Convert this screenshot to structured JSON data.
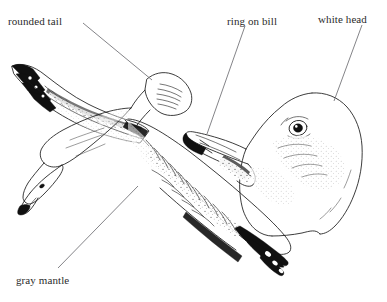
{
  "plate": {
    "title": "Ring-billed Gull field guide plate",
    "background_color": "#ffffff",
    "ink_color": "#1a1a1a",
    "label_color": "#2b2b2b",
    "leader_color": "#6e6e73",
    "width": 387,
    "height": 302
  },
  "labels": [
    {
      "id": "rounded-tail",
      "text": "rounded tail",
      "x": 8,
      "y": 15,
      "leader": {
        "x1": 83,
        "y1": 23,
        "x2": 152,
        "y2": 80
      }
    },
    {
      "id": "ring-on-bill",
      "text": "ring on bill",
      "x": 227,
      "y": 15,
      "leader": {
        "x1": 245,
        "y1": 26,
        "x2": 207,
        "y2": 134
      }
    },
    {
      "id": "white-head",
      "text": "white head",
      "x": 318,
      "y": 13,
      "leader": {
        "x1": 362,
        "y1": 25,
        "x2": 334,
        "y2": 101
      }
    },
    {
      "id": "gray-mantle",
      "text": "gray mantle",
      "x": 16,
      "y": 274,
      "leader": {
        "x1": 58,
        "y1": 268,
        "x2": 138,
        "y2": 186
      }
    }
  ],
  "figures": [
    {
      "id": "gull-in-flight",
      "name": "Gull seen from below in flight",
      "features": [
        "rounded tail",
        "gray mantle",
        "black wingtips with white mirrors",
        "white underparts",
        "pale head with dark-tipped bill"
      ]
    },
    {
      "id": "gull-head-portrait",
      "name": "Gull head profile facing left",
      "features": [
        "white head",
        "dark ring near bill tip",
        "pale eye with dark pupil",
        "faint gray streaking behind eye"
      ]
    }
  ]
}
